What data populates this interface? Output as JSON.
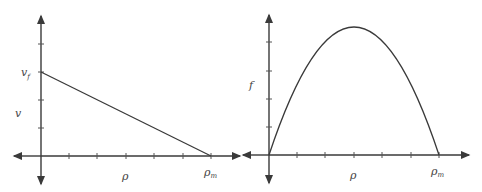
{
  "diagrams": [
    {
      "name": "velocity-density",
      "type": "line",
      "x_label": "ρ",
      "y_label": "v",
      "y_intercept_label": "v",
      "y_intercept_sub": "f",
      "x_intercept_label": "ρ",
      "x_intercept_sub": "m",
      "x_ticks": 6,
      "y_ticks": 4
    },
    {
      "name": "flux-density",
      "type": "parabola",
      "x_label": "ρ",
      "y_label": "f",
      "x_intercept_label": "ρ",
      "x_intercept_sub": "m",
      "x_ticks": 6,
      "y_ticks": 4
    }
  ],
  "colors": {
    "line": "#3a3a3a",
    "text": "#444444",
    "background": "#ffffff"
  }
}
